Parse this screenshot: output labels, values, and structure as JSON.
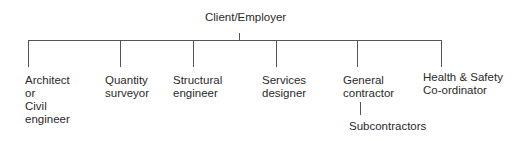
{
  "diagram": {
    "type": "org-chart",
    "root": {
      "label": "Client/Employer"
    },
    "children": [
      {
        "label": "Architect\nor\nCivil\nengineer"
      },
      {
        "label": "Quantity\nsurveyor"
      },
      {
        "label": "Structural\nengineer"
      },
      {
        "label": "Services\ndesigner"
      },
      {
        "label": "General\ncontractor",
        "children": [
          {
            "label": "Subcontractors"
          }
        ]
      },
      {
        "label": "Health & Safety\nCo-ordinator"
      }
    ],
    "colors": {
      "line": "#555555",
      "text": "#2a2a2a",
      "background": "#ffffff"
    }
  }
}
